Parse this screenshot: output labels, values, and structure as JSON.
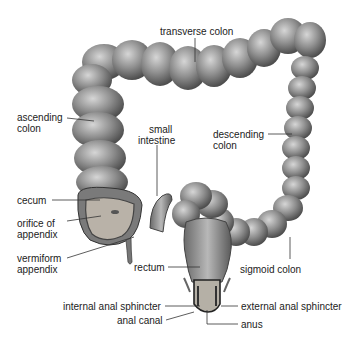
{
  "diagram": {
    "labels": {
      "transverse_colon": "transverse colon",
      "ascending_colon": [
        "ascending",
        "colon"
      ],
      "small_intestine": [
        "small",
        "intestine"
      ],
      "descending_colon": [
        "descending",
        "colon"
      ],
      "cecum": "cecum",
      "orifice_of_appendix": [
        "orifice of",
        "appendix"
      ],
      "vermiform_appendix": [
        "vermiform",
        "appendix"
      ],
      "rectum": "rectum",
      "sigmoid_colon": "sigmoid colon",
      "internal_anal_sphincter": "internal anal sphincter",
      "external_anal_sphincter": "external anal sphincter",
      "anal_canal": "anal canal",
      "anus": "anus"
    },
    "colors": {
      "organ_fill": "#8a8a8a",
      "organ_dark": "#555555",
      "organ_light": "#c8c8c8",
      "leader_line": "#333333",
      "background": "#ffffff"
    }
  }
}
